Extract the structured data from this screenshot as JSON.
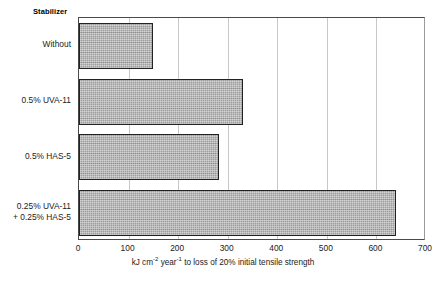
{
  "chart_data": {
    "type": "bar",
    "orientation": "horizontal",
    "title": "",
    "legend_title": "Stabilizer",
    "categories": [
      "Without",
      "0.5% UVA-11",
      "0.5% HAS-5",
      "0.25% UVA-11\n+ 0.25% HAS-5"
    ],
    "values": [
      149,
      331,
      282,
      639
    ],
    "xlabel_parts": {
      "a": "kJ cm",
      "sup1": "-2",
      "b": " year",
      "sup2": "-1",
      "c": " to loss of 20% initial tensile strength"
    },
    "xlabel": "kJ cm-2 year-1 to loss of 20% initial tensile strength",
    "ylabel": "",
    "xlim": [
      0,
      700
    ],
    "xticks": [
      0,
      100,
      200,
      300,
      400,
      500,
      600,
      700
    ],
    "xtick_labels": [
      "0",
      "100",
      "200",
      "300",
      "400",
      "500",
      "600",
      "700"
    ],
    "grid": "vertical",
    "legend_position": "none",
    "bar_fill_color": "#9d9d9d",
    "bar_edge_color": "#222222",
    "gridline_color": "#c8c8c8",
    "axis_color": "#4a4a4a",
    "background_color": "#ffffff"
  },
  "categories_display": [
    {
      "line1": "Without",
      "line2": ""
    },
    {
      "line1": "0.5% UVA-11",
      "line2": ""
    },
    {
      "line1": "0.5% HAS-5",
      "line2": ""
    },
    {
      "line1": "0.25% UVA-11",
      "line2": "+ 0.25% HAS-5"
    }
  ]
}
